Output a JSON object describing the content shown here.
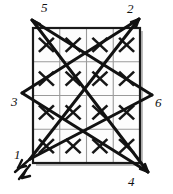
{
  "figure": {
    "colors": {
      "background": "#ffffff",
      "grid_border": "#1a1a1a",
      "grid_interior": "#9a9a9a",
      "grid_shadow": "#b9b9b9",
      "star_line": "#121212",
      "x_mark": "#161616",
      "label_text": "#111111"
    },
    "grid": {
      "rows": 4,
      "columns": 4,
      "cell_mark": "X",
      "left": 33,
      "top": 28,
      "right": 140,
      "bottom": 163,
      "marks": [
        [
          "X",
          "X",
          "X",
          "X"
        ],
        [
          "X",
          "X",
          "X",
          "X"
        ],
        [
          "X",
          "X",
          "X",
          "X"
        ],
        [
          "X",
          "X",
          "X",
          "X"
        ]
      ]
    },
    "vertices": [
      {
        "id": "1",
        "label": "1",
        "x": 30,
        "y": 159,
        "label_x": 14,
        "label_y": 148,
        "arrow": "double"
      },
      {
        "id": "2",
        "label": "2",
        "x": 139,
        "y": 19,
        "label_x": 127,
        "label_y": 3,
        "arrow": "single"
      },
      {
        "id": "3",
        "label": "3",
        "x": 22,
        "y": 93,
        "label_x": 11,
        "label_y": 96,
        "arrow": "none"
      },
      {
        "id": "4",
        "label": "4",
        "x": 148,
        "y": 172,
        "label_x": 128,
        "label_y": 176,
        "arrow": "single"
      },
      {
        "id": "5",
        "label": "5",
        "x": 32,
        "y": 20,
        "label_x": 41,
        "label_y": 2,
        "arrow": "none"
      },
      {
        "id": "6",
        "label": "6",
        "x": 152,
        "y": 95,
        "label_x": 155,
        "label_y": 97,
        "arrow": "none"
      }
    ],
    "edges": [
      {
        "from": "5",
        "to": "4"
      },
      {
        "from": "4",
        "to": "3"
      },
      {
        "from": "3",
        "to": "2"
      },
      {
        "from": "2",
        "to": "1"
      },
      {
        "from": "1",
        "to": "6"
      },
      {
        "from": "6",
        "to": "5"
      }
    ]
  }
}
